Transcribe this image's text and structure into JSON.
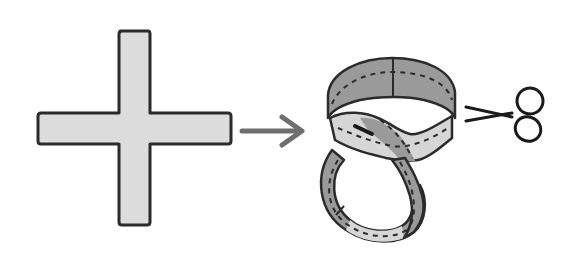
{
  "diagram": {
    "description": "Paper cross shape is folded into two interlinked paper rings, then cut with scissors",
    "elements": [
      {
        "id": "cross",
        "label": "paper-cross"
      },
      {
        "id": "arrow",
        "label": "transform-arrow"
      },
      {
        "id": "rings",
        "label": "interlinked-paper-rings"
      },
      {
        "id": "scissors",
        "label": "scissors"
      }
    ],
    "colors": {
      "background": "#ffffff",
      "outline": "#2b2b2b",
      "cross_fill": "#dcdcdc",
      "ring_dark": "#9a9a9a",
      "ring_light": "#d6d6d6",
      "arrow": "#6e6e6e",
      "dashes": "#2b2b2b"
    }
  }
}
